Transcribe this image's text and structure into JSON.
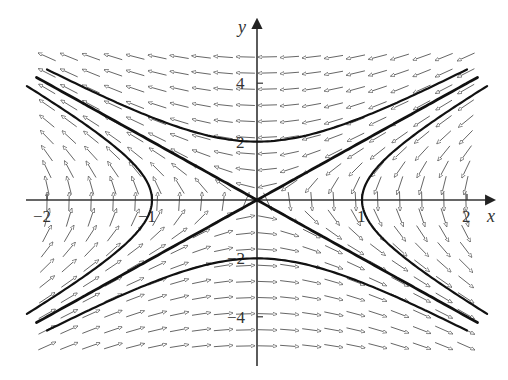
{
  "figure": {
    "type": "phase_portrait",
    "system": "dx/dt = -y, dy/dt = -4x",
    "x_axis": {
      "label": "x",
      "ticks": [
        -2,
        -1,
        1,
        2
      ],
      "tick_labels": [
        "−2",
        "−1",
        "1",
        "2"
      ]
    },
    "y_axis": {
      "label": "y",
      "ticks": [
        4,
        2,
        -2,
        -4
      ],
      "tick_labels": [
        "4",
        "2",
        "−2",
        "−4"
      ]
    },
    "xlim": [
      -2.1,
      2.1
    ],
    "ylim": [
      -5.5,
      5.5
    ],
    "colors": {
      "field_arrow": "#555555",
      "trajectory": "#111111",
      "axis": "#333333",
      "background": "#ffffff"
    }
  },
  "pixel_map": {
    "origin_x": 257,
    "origin_y": 200,
    "px_per_x": 105,
    "px_per_y": 29.2
  },
  "direction_field": {
    "x_start": -2.0,
    "x_end": 2.0,
    "x_step": 0.21,
    "y_start": -5.0,
    "y_end": 5.3,
    "y_step": 0.55,
    "arrow_length_px": 19
  },
  "trajectories": [
    {
      "name": "separatrix-positive",
      "equation": "y = 2x",
      "x_range": [
        -2.1,
        2.1
      ]
    },
    {
      "name": "separatrix-negative",
      "equation": "y = -2x",
      "x_range": [
        -2.1,
        2.1
      ]
    },
    {
      "name": "hyperbola-upper",
      "equation": "y^2 - 4x^2 = 4, y>0",
      "x_range": [
        -2.0,
        2.0
      ]
    },
    {
      "name": "hyperbola-lower",
      "equation": "y^2 - 4x^2 = 4, y<0",
      "x_range": [
        -2.0,
        2.0
      ]
    },
    {
      "name": "hyperbola-right",
      "equation": "4x^2 - y^2 = 4, x>0",
      "y_range": [
        -3.9,
        3.9
      ]
    },
    {
      "name": "hyperbola-left",
      "equation": "4x^2 - y^2 = 4, x<0",
      "y_range": [
        -3.9,
        3.9
      ]
    }
  ]
}
